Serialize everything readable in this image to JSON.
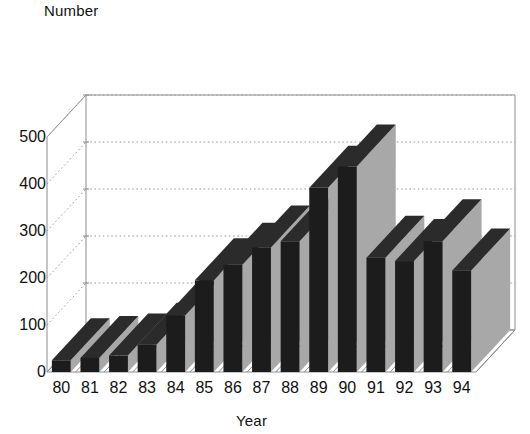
{
  "chart_data": {
    "type": "bar",
    "title": "",
    "subtitle": "",
    "xlabel": "Year",
    "ylabel": "Number",
    "categories": [
      "80",
      "81",
      "82",
      "83",
      "84",
      "85",
      "86",
      "87",
      "88",
      "89",
      "90",
      "91",
      "92",
      "93",
      "94"
    ],
    "values": [
      25,
      30,
      35,
      58,
      120,
      195,
      228,
      265,
      278,
      392,
      437,
      243,
      236,
      278,
      216
    ],
    "ylim": [
      0,
      500
    ],
    "y_ticks": [
      0,
      100,
      200,
      300,
      400,
      500
    ],
    "y_tick_labels": [
      "0",
      "100",
      "200",
      "300",
      "400",
      "500"
    ],
    "grid": true,
    "legend": null,
    "legend_position": "none",
    "projection": "3d",
    "series": [
      {
        "name": "Number",
        "values": [
          25,
          30,
          35,
          58,
          120,
          195,
          228,
          265,
          278,
          392,
          437,
          243,
          236,
          278,
          216
        ]
      }
    ],
    "colors": {
      "bar_front": "#1c1c1c",
      "bar_side": "#a8a8a8",
      "bar_top": "#2b2b2b",
      "gridline": "#9a9a9a",
      "frame": "#8c8c8c",
      "background": "#ffffff",
      "text": "#111111"
    }
  }
}
